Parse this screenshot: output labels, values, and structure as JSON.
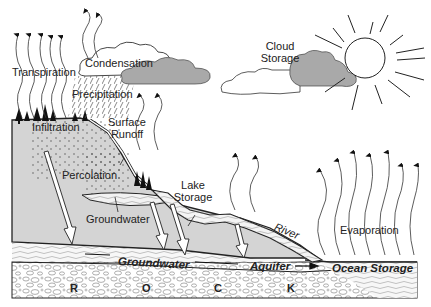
{
  "diagram": {
    "labels": {
      "transpiration": "Transpiration",
      "condensation": "Condensation",
      "precipitation": "Precipitation",
      "cloud_storage_1": "Cloud",
      "cloud_storage_2": "Storage",
      "infiltration": "Infiltration",
      "surface_runoff_1": "Surface",
      "surface_runoff_2": "Runoff",
      "percolation": "Percolation",
      "lake_storage_1": "Lake",
      "lake_storage_2": "Storage",
      "groundwater_upper": "Groundwater",
      "river": "River",
      "evaporation": "Evaporation",
      "groundwater_lower": "Groundwater",
      "aquifer": "Aquifer",
      "ocean_storage": "Ocean Storage",
      "rock_r": "R",
      "rock_o": "O",
      "rock_c": "C",
      "rock_k": "K"
    },
    "colors": {
      "land": "#d4d4d4",
      "cloud_dark": "#a9a9a9",
      "outline": "#222222",
      "water": "#f4f4f4"
    }
  }
}
